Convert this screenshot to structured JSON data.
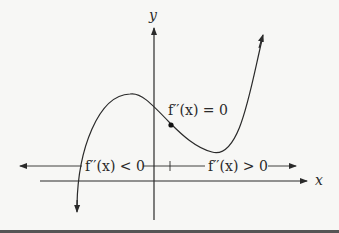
{
  "figure": {
    "axes": {
      "x_label": "x",
      "y_label": "y"
    },
    "annotations": {
      "inflection_label": "f′′(x) = 0",
      "concave_down_label": "f′′(x) < 0",
      "concave_up_label": "f′′(x) > 0"
    },
    "colors": {
      "ink": "#2a2a2a",
      "background": "#f7f7f5",
      "bottom_rule": "#555555"
    }
  }
}
